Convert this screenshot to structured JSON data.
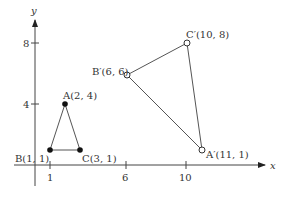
{
  "axes": {
    "x_label": "x",
    "y_label": "y",
    "x_ticks": [
      {
        "value": 1,
        "label": "1"
      },
      {
        "value": 6,
        "label": "6"
      },
      {
        "value": 10,
        "label": "10"
      }
    ],
    "y_ticks": [
      {
        "value": 4,
        "label": "4"
      },
      {
        "value": 8,
        "label": "8"
      }
    ]
  },
  "original_triangle": {
    "points": [
      {
        "name": "A",
        "label": "A(2, 4)",
        "x": 2,
        "y": 4
      },
      {
        "name": "B",
        "label": "B(1, 1)",
        "x": 1,
        "y": 1
      },
      {
        "name": "C",
        "label": "C(3, 1)",
        "x": 3,
        "y": 1
      }
    ],
    "marker": "filled"
  },
  "image_triangle": {
    "points": [
      {
        "name": "A'",
        "label": "A′(11, 1)",
        "x": 11,
        "y": 1
      },
      {
        "name": "B'",
        "label": "B′(6, 6)",
        "x": 6,
        "y": 6
      },
      {
        "name": "C'",
        "label": "C′(10, 8)",
        "x": 10,
        "y": 8
      }
    ],
    "marker": "open"
  },
  "colors": {
    "line": "#444444",
    "text": "#333333"
  }
}
